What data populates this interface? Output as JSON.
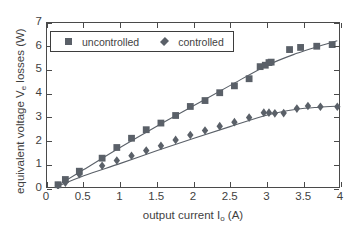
{
  "chart_data": {
    "type": "scatter",
    "title": "",
    "xlabel": "output current I_o (A)",
    "ylabel": "equivalent voltage V_e losses  (W)",
    "xlim": [
      0,
      4
    ],
    "ylim": [
      0,
      7
    ],
    "xticks": [
      0,
      0.5,
      1,
      1.5,
      2,
      2.5,
      3,
      3.5,
      4
    ],
    "xticklabels": [
      "0",
      "0.5",
      "1",
      "1.5",
      "2",
      "2.5",
      "3",
      "3.5",
      "4"
    ],
    "yticks": [
      0,
      1,
      2,
      3,
      4,
      5,
      6,
      7
    ],
    "yticklabels": [
      "0",
      "1",
      "2",
      "3",
      "4",
      "5",
      "6",
      "7"
    ],
    "grid": false,
    "legend_position": "upper left",
    "marker_color": "#5a6068",
    "line_color": "#5a6068",
    "series": [
      {
        "name": "uncontrolled",
        "marker": "square",
        "x": [
          0.15,
          0.25,
          0.44,
          0.75,
          0.95,
          1.15,
          1.35,
          1.55,
          1.75,
          1.95,
          2.15,
          2.35,
          2.55,
          2.75,
          2.9,
          2.97,
          3.02,
          3.05,
          3.3,
          3.45,
          3.67,
          3.88
        ],
        "y": [
          0.18,
          0.4,
          0.75,
          1.3,
          1.75,
          2.14,
          2.5,
          2.78,
          3.1,
          3.48,
          3.73,
          4.06,
          4.35,
          4.65,
          5.16,
          5.22,
          5.33,
          5.35,
          5.88,
          5.97,
          6.02,
          6.09
        ],
        "fit_x": [
          0.12,
          0.5,
          1.0,
          1.5,
          2.0,
          2.5,
          3.0,
          3.4,
          3.7,
          3.95
        ],
        "fit_y": [
          0.1,
          0.82,
          1.76,
          2.66,
          3.52,
          4.38,
          5.22,
          5.72,
          6.02,
          6.25
        ]
      },
      {
        "name": "controlled",
        "marker": "diamond",
        "x": [
          0.15,
          0.25,
          0.44,
          0.75,
          0.95,
          1.15,
          1.35,
          1.55,
          1.75,
          1.95,
          2.15,
          2.35,
          2.55,
          2.75,
          2.95,
          3.02,
          3.1,
          3.22,
          3.4,
          3.55,
          3.72,
          3.95
        ],
        "y": [
          0.14,
          0.27,
          0.62,
          0.98,
          1.2,
          1.4,
          1.62,
          1.82,
          2.07,
          2.28,
          2.47,
          2.65,
          2.82,
          3.01,
          3.22,
          3.22,
          3.19,
          3.2,
          3.39,
          3.5,
          3.47,
          3.47
        ],
        "fit_x": [
          0.12,
          0.5,
          1.0,
          1.5,
          2.0,
          2.5,
          3.0,
          3.4,
          3.7,
          3.98
        ],
        "fit_y": [
          0.08,
          0.56,
          1.08,
          1.62,
          2.14,
          2.64,
          3.12,
          3.36,
          3.45,
          3.5
        ]
      }
    ]
  },
  "legend": {
    "items": [
      {
        "label": "uncontrolled",
        "marker": "square-marker-icon"
      },
      {
        "label": "controlled",
        "marker": "diamond-marker-icon"
      }
    ]
  },
  "axes": {
    "xlabel_main": "output current I",
    "xlabel_sub": "o",
    "xlabel_unit": " (A)",
    "ylabel_pre": "equivalent voltage V",
    "ylabel_sub": "e",
    "ylabel_post": " losses  (W)"
  }
}
